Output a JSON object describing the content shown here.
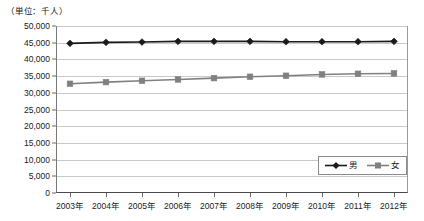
{
  "chart_data": {
    "type": "line",
    "title": "",
    "unit_note": "（単位：千人）",
    "xlabel": "",
    "ylabel": "",
    "categories": [
      "2003年",
      "2004年",
      "2005年",
      "2006年",
      "2007年",
      "2008年",
      "2009年",
      "2010年",
      "2011年",
      "2012年"
    ],
    "series": [
      {
        "name": "男",
        "marker": "diamond",
        "color": "#1a1a1a",
        "values": [
          44800,
          45100,
          45200,
          45400,
          45400,
          45400,
          45300,
          45300,
          45300,
          45400
        ]
      },
      {
        "name": "女",
        "marker": "square",
        "color": "#808080",
        "values": [
          32700,
          33200,
          33600,
          34000,
          34400,
          34800,
          35100,
          35500,
          35700,
          35800
        ]
      }
    ],
    "ylim": [
      0,
      50000
    ],
    "yticks": [
      0,
      5000,
      10000,
      15000,
      20000,
      25000,
      30000,
      35000,
      40000,
      45000,
      50000
    ],
    "ytick_labels": [
      "0",
      "5,000",
      "10,000",
      "15,000",
      "20,000",
      "25,000",
      "30,000",
      "35,000",
      "40,000",
      "45,000",
      "50,000"
    ],
    "grid": true,
    "legend_position": "bottom-right"
  }
}
